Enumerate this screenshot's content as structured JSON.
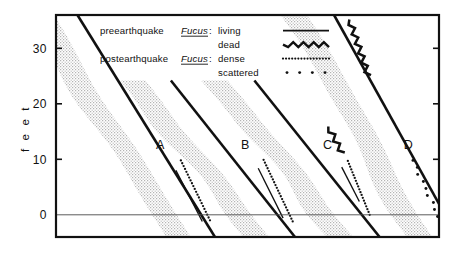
{
  "figure": {
    "axis": {
      "y_label": "f e e t",
      "y_ticks": [
        "0",
        "10",
        "20",
        "30"
      ],
      "y_tick_values": [
        0,
        10,
        20,
        30
      ],
      "ylim": [
        -4,
        36
      ],
      "zero_line": 0,
      "x_label": "",
      "grid": false
    },
    "legend": {
      "rows": [
        {
          "category": "preearthquake",
          "genus": "Fucus",
          "colon": ":",
          "state": "living",
          "sample": "solid-line"
        },
        {
          "category": "",
          "genus": "",
          "colon": "",
          "state": "dead",
          "sample": "zigzag-line"
        },
        {
          "category": "postearthquake",
          "genus": "Fucus",
          "colon": ":",
          "state": "dense",
          "sample": "dense-dots"
        },
        {
          "category": "",
          "genus": "",
          "colon": "",
          "state": "scattered",
          "sample": "scattered-dots"
        }
      ]
    }
  },
  "chart_data": {
    "type": "line",
    "title": "",
    "xlabel": "",
    "ylabel": "feet",
    "ylim": [
      -4,
      36
    ],
    "xlim": [
      0,
      100
    ],
    "yticks": [
      0,
      10,
      20,
      30
    ],
    "grid": false,
    "legend_position": "top-center",
    "legend_entries": [
      "preearthquake Fucus: living",
      "preearthquake Fucus: dead",
      "postearthquake Fucus: dense",
      "postearthquake Fucus: scattered"
    ],
    "annotations": [
      "A",
      "B",
      "C",
      "D"
    ],
    "series": [
      {
        "name": "A",
        "label_xy": [
          27.2,
          11.8
        ],
        "profile": {
          "x": [
            5.6,
            41.5
          ],
          "y": [
            36.0,
            -4.0
          ]
        },
        "band_offset_x": -6.6,
        "band_width_x": 6.6,
        "living": {
          "x": [
            31.3,
            38.2
          ],
          "y": [
            8.0,
            -1.2
          ]
        },
        "dead": null,
        "dense": {
          "x": [
            32.6,
            40.2
          ],
          "y": [
            9.8,
            -1.0
          ]
        },
        "scattered": null
      },
      {
        "name": "B",
        "label_xy": [
          49.4,
          11.8
        ],
        "profile": {
          "x": [
            30.0,
            62.4
          ],
          "y": [
            24.2,
            -4.0
          ]
        },
        "band_offset_x": -6.6,
        "band_width_x": 6.6,
        "living": {
          "x": [
            52.8,
            59.3
          ],
          "y": [
            8.4,
            -0.6
          ]
        },
        "dead": null,
        "dense": {
          "x": [
            54.2,
            61.8
          ],
          "y": [
            9.9,
            -1.2
          ]
        },
        "scattered": null
      },
      {
        "name": "C",
        "label_xy": [
          70.9,
          11.8
        ],
        "profile": {
          "x": [
            51.8,
            84.5
          ],
          "y": [
            24.2,
            -4.0
          ]
        },
        "band_offset_x": -6.6,
        "band_width_x": 6.6,
        "living": {
          "x": [
            74.6,
            79.2
          ],
          "y": [
            8.6,
            2.4
          ]
        },
        "dead": {
          "x": [
            71.1,
            74.8
          ],
          "y": [
            15.9,
            11.0
          ]
        },
        "dense": {
          "x": [
            76.2,
            81.9
          ],
          "y": [
            9.7,
            0.0
          ]
        },
        "scattered": null
      },
      {
        "name": "D",
        "label_xy": [
          92.0,
          11.8
        ],
        "profile": {
          "x": [
            72.6,
            104.8
          ],
          "y": [
            36.0,
            -4.0
          ]
        },
        "band_offset_x": -6.6,
        "band_width_x": 6.6,
        "living": null,
        "dead": {
          "x": [
            76.6,
            81.6
          ],
          "y": [
            35.2,
            25.0
          ]
        },
        "dense": null,
        "scattered": {
          "x": [
            93.2,
            99.8
          ],
          "y": [
            9.8,
            -0.3
          ]
        }
      }
    ]
  }
}
